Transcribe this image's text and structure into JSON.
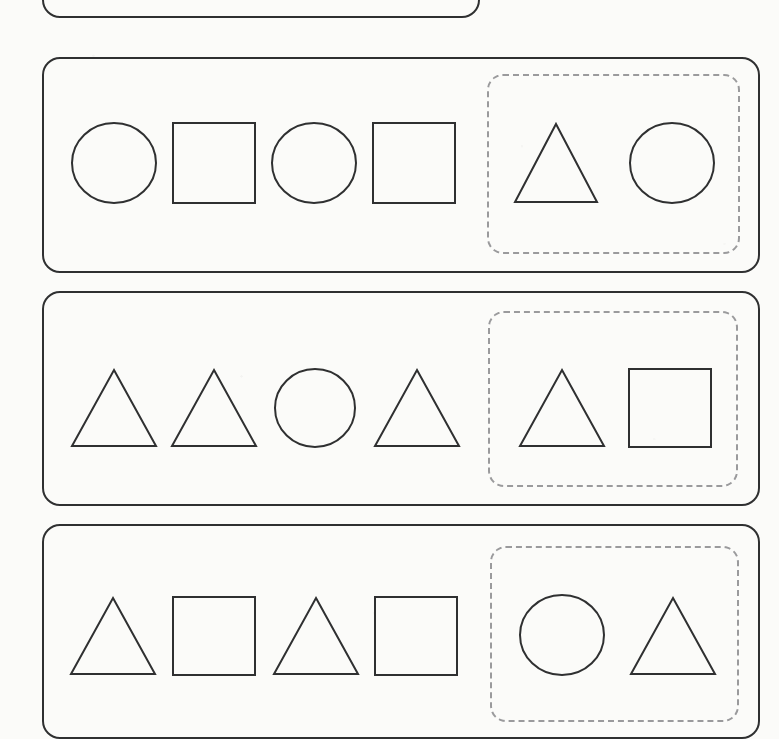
{
  "worksheet": {
    "title": "Shape Pattern Worksheet",
    "background_color": "#fbfbf9",
    "ink_color": "#2f3031",
    "dashed_color": "#9a9a9c",
    "stroke_width": 2
  },
  "rows": [
    {
      "id": "row-0",
      "label": "Pattern row 1 (partially visible, cut off at top)",
      "clipped": true,
      "card": {
        "x": 42,
        "y": -64,
        "width": 438,
        "height": 82,
        "radius": 18
      },
      "sequence": [],
      "answer_zone": null
    },
    {
      "id": "row-1",
      "label": "Pattern row 2",
      "clipped": false,
      "card": {
        "x": 42,
        "y": 57,
        "width": 718,
        "height": 216,
        "radius": 18
      },
      "sequence": [
        {
          "shape": "circle",
          "x": 71,
          "y": 122,
          "width": 86,
          "height": 82
        },
        {
          "shape": "square",
          "x": 172,
          "y": 122,
          "width": 84,
          "height": 82
        },
        {
          "shape": "circle",
          "x": 271,
          "y": 122,
          "width": 86,
          "height": 82
        },
        {
          "shape": "square",
          "x": 372,
          "y": 122,
          "width": 84,
          "height": 82
        }
      ],
      "answer_zone": {
        "x": 487,
        "y": 74,
        "width": 253,
        "height": 180,
        "radius": 16,
        "options": [
          {
            "shape": "triangle",
            "x": 513,
            "y": 122,
            "width": 86,
            "height": 82
          },
          {
            "shape": "circle",
            "x": 629,
            "y": 122,
            "width": 86,
            "height": 82
          }
        ]
      },
      "pattern": [
        "circle",
        "square",
        "circle",
        "square"
      ],
      "choices": [
        "triangle",
        "circle"
      ],
      "correct_choice": "circle"
    },
    {
      "id": "row-2",
      "label": "Pattern row 3",
      "clipped": false,
      "card": {
        "x": 42,
        "y": 291,
        "width": 718,
        "height": 215,
        "radius": 18
      },
      "sequence": [
        {
          "shape": "triangle",
          "x": 70,
          "y": 368,
          "width": 88,
          "height": 80
        },
        {
          "shape": "triangle",
          "x": 170,
          "y": 368,
          "width": 88,
          "height": 80
        },
        {
          "shape": "circle",
          "x": 273,
          "y": 368,
          "width": 84,
          "height": 80
        },
        {
          "shape": "triangle",
          "x": 373,
          "y": 368,
          "width": 88,
          "height": 80
        }
      ],
      "answer_zone": {
        "x": 488,
        "y": 311,
        "width": 250,
        "height": 176,
        "radius": 16,
        "options": [
          {
            "shape": "triangle",
            "x": 518,
            "y": 368,
            "width": 88,
            "height": 80
          },
          {
            "shape": "square",
            "x": 628,
            "y": 368,
            "width": 84,
            "height": 80
          }
        ]
      },
      "pattern": [
        "triangle",
        "triangle",
        "circle",
        "triangle"
      ],
      "choices": [
        "triangle",
        "square"
      ],
      "correct_choice": "triangle"
    },
    {
      "id": "row-3",
      "label": "Pattern row 4 (partially visible, cut off at bottom)",
      "clipped": true,
      "card": {
        "x": 42,
        "y": 524,
        "width": 718,
        "height": 215,
        "radius": 18
      },
      "sequence": [
        {
          "shape": "triangle",
          "x": 69,
          "y": 596,
          "width": 88,
          "height": 80
        },
        {
          "shape": "triangle",
          "x": 172,
          "y": 596,
          "width": 88,
          "height": 80,
          "variant": "square-slot"
        },
        {
          "shape": "triangle",
          "x": 272,
          "y": 596,
          "width": 88,
          "height": 80
        },
        {
          "shape": "square",
          "x": 374,
          "y": 596,
          "width": 84,
          "height": 80
        }
      ],
      "answer_zone": {
        "x": 490,
        "y": 546,
        "width": 249,
        "height": 176,
        "radius": 16,
        "options": [
          {
            "shape": "circle",
            "x": 519,
            "y": 594,
            "width": 86,
            "height": 82
          },
          {
            "shape": "triangle",
            "x": 629,
            "y": 596,
            "width": 88,
            "height": 80
          }
        ]
      },
      "pattern": [
        "triangle",
        "square",
        "triangle",
        "square"
      ],
      "choices": [
        "circle",
        "triangle"
      ],
      "correct_choice": "triangle"
    }
  ],
  "shape_glyphs": {
    "circle": "circle-icon",
    "square": "square-icon",
    "triangle": "triangle-icon"
  }
}
